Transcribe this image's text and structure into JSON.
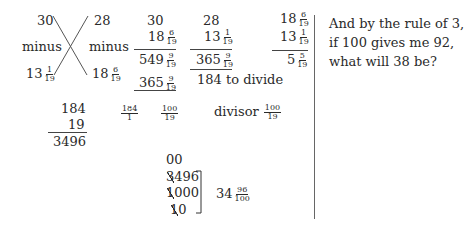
{
  "cross_diagram": {
    "top_left": "30",
    "top_right": "28",
    "mid_left": "minus",
    "mid_right": "minus",
    "bottom_left_whole": "13",
    "bottom_left_num": "1",
    "bottom_left_den": "19",
    "bottom_right_whole": "18",
    "bottom_right_num": "6",
    "bottom_right_den": "19"
  },
  "calc_a": {
    "top": "30",
    "second_whole": "18",
    "second_num": "6",
    "second_den": "19",
    "result_whole": "549",
    "result_num": "9",
    "result_den": "19",
    "sub_whole": "365",
    "sub_num": "9",
    "sub_den": "19"
  },
  "calc_b": {
    "top": "28",
    "second_whole": "13",
    "second_num": "1",
    "second_den": "19",
    "result_whole": "365",
    "result_num": "9",
    "result_den": "19",
    "note": "184 to divide"
  },
  "calc_c": {
    "a_whole": "18",
    "a_num": "6",
    "a_den": "19",
    "b_whole": "13",
    "b_num": "1",
    "b_den": "19",
    "r_whole": "5",
    "r_num": "5",
    "r_den": "19"
  },
  "multiplication": {
    "top": "184",
    "second": "19",
    "result": "3496"
  },
  "fractions_row": {
    "f1_num": "184",
    "f1_den": "1",
    "f2_num": "100",
    "f2_den": "19",
    "divisor_label": "divisor",
    "divisor_num": "100",
    "divisor_den": "19"
  },
  "galley_division": {
    "row0": "00",
    "row1_struck": "3",
    "row1_rest": "496",
    "row2_struck": "1",
    "row2_rest": "000",
    "row3_struck": "1",
    "row3_rest": "0",
    "quotient_whole": "34",
    "quotient_num": "96",
    "quotient_den": "100"
  },
  "side_text": {
    "line1": "And by the rule of 3,",
    "line2": "if 100 gives me 92,",
    "line3": "what will 38 be?"
  }
}
